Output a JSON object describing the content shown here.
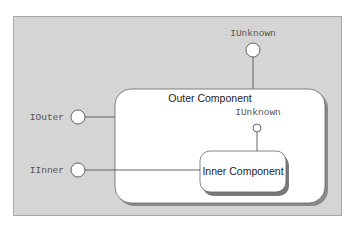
{
  "diagram": {
    "outer_component": {
      "label": "Outer Component"
    },
    "inner_component": {
      "label": "Inner Component"
    },
    "interfaces": {
      "outer_iunknown": {
        "label": "IUnknown"
      },
      "iouter": {
        "label": "IOuter"
      },
      "iinner": {
        "label": "IInner"
      },
      "inner_iunknown": {
        "label": "IUnknown"
      }
    },
    "colors": {
      "background_panel": "#d5d5d5",
      "component_fill": "#ffffff",
      "shadow": "#8a8a8a",
      "line": "#555555"
    }
  }
}
